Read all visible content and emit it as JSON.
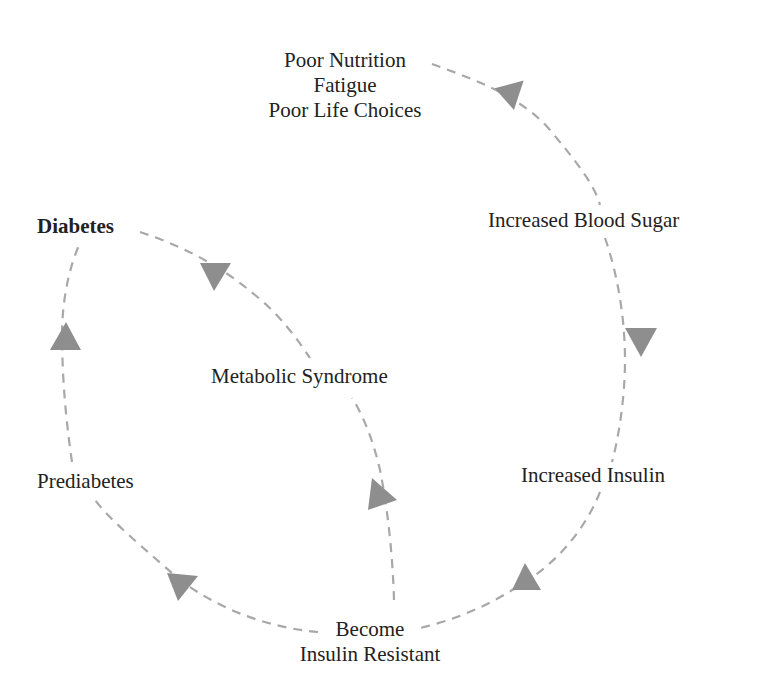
{
  "diagram": {
    "type": "cycle",
    "colors": {
      "edge": "#a8a8a8",
      "arrow": "#8e8e8e",
      "text": "#222222"
    },
    "nodes": [
      {
        "id": "causes",
        "lines": [
          "Poor Nutrition",
          "Fatigue",
          "Poor Life Choices"
        ]
      },
      {
        "id": "blood_sugar",
        "label": "Increased Blood Sugar"
      },
      {
        "id": "insulin",
        "label": "Increased Insulin"
      },
      {
        "id": "resistant",
        "lines": [
          "Become",
          "Insulin Resistant"
        ]
      },
      {
        "id": "prediabetes",
        "label": "Prediabetes"
      },
      {
        "id": "diabetes",
        "label": "Diabetes",
        "bold": true
      },
      {
        "id": "metabolic",
        "label": "Metabolic Syndrome"
      }
    ],
    "edges": [
      {
        "from": "causes",
        "to": "blood_sugar"
      },
      {
        "from": "blood_sugar",
        "to": "insulin"
      },
      {
        "from": "insulin",
        "to": "resistant"
      },
      {
        "from": "resistant",
        "to": "prediabetes"
      },
      {
        "from": "prediabetes",
        "to": "diabetes"
      },
      {
        "from": "diabetes",
        "to": "metabolic"
      },
      {
        "from": "resistant",
        "to": "metabolic"
      }
    ]
  }
}
